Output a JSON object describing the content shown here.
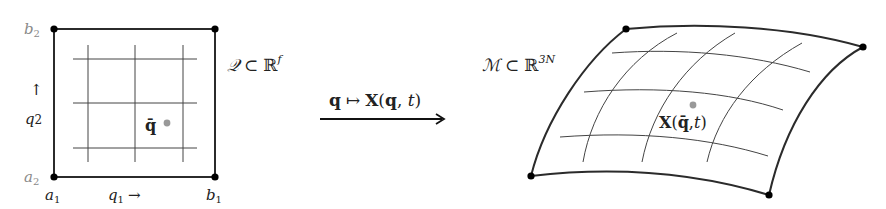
{
  "diagram": {
    "left": {
      "set_label": {
        "calligraphic": "𝒬",
        "subset": "⊂",
        "space": "ℝ",
        "exponent": "f"
      },
      "corner_labels": {
        "b2": {
          "base": "b",
          "sub": "2"
        },
        "a2": {
          "base": "a",
          "sub": "2"
        },
        "a1": {
          "base": "a",
          "sub": "1"
        },
        "b1": {
          "base": "b",
          "sub": "1"
        }
      },
      "axis_q1": {
        "base": "q",
        "sub": "1",
        "arrow": "→"
      },
      "axis_q2": {
        "base": "q",
        "sub": "2",
        "arrow": "↑"
      },
      "point_label": "q̄",
      "point_color": "#999999"
    },
    "mapping": {
      "from": "q",
      "mapsto": "↦",
      "to_func": "X",
      "to_args": "(q, t)",
      "args_open": "(",
      "args_q": "q",
      "args_sep": ", ",
      "args_t": "t",
      "args_close": ")"
    },
    "right": {
      "set_label": {
        "calligraphic": "ℳ",
        "subset": "⊂",
        "space": "ℝ",
        "exponent": "3N"
      },
      "point_label_func": "X",
      "point_label_open": "(",
      "point_label_q": "q̄",
      "point_label_sep": ",",
      "point_label_t": "t",
      "point_label_close": ")",
      "point_color": "#999999"
    },
    "colors": {
      "edge": "#2b2b2b",
      "grid": "#444444",
      "corner_dot": "#000000",
      "label_gray": "#8a8a8a"
    }
  }
}
